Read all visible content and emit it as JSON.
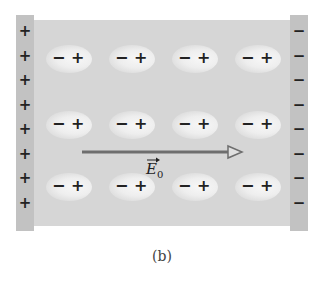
{
  "figure": {
    "caption": "(b)",
    "field_label": {
      "symbol": "E",
      "subscript": "0",
      "has_vector_arrow": true
    },
    "left_plate": {
      "charge_symbol": "+",
      "count": 8,
      "color": "#c2c2c2"
    },
    "right_plate": {
      "charge_symbol": "−",
      "count": 8,
      "color": "#c2c2c2"
    },
    "dielectric": {
      "color": "#d6d6d6",
      "rows": 3,
      "columns": 4
    },
    "dipole": {
      "negative_symbol": "−",
      "positive_symbol": "+"
    },
    "arrow": {
      "direction": "right",
      "color": "#6e6e6e"
    }
  }
}
